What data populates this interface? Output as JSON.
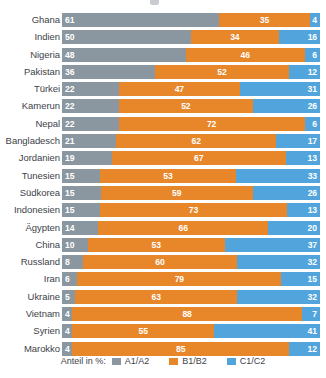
{
  "chart_data": {
    "type": "bar",
    "subtype": "horizontal-100-percent-stacked",
    "title": "",
    "xlabel": "",
    "ylabel": "",
    "xlim": [
      0,
      100
    ],
    "grid": false,
    "legend_position": "bottom",
    "legend_title": "Anteil in %:",
    "categories": [
      "Ghana",
      "Indien",
      "Nigeria",
      "Pakistan",
      "Türkei",
      "Kamerun",
      "Nepal",
      "Bangladesch",
      "Jordanien",
      "Tunesien",
      "Südkorea",
      "Indonesien",
      "Ägypten",
      "China",
      "Russland",
      "Iran",
      "Ukraine",
      "Vietnam",
      "Syrien",
      "Marokko"
    ],
    "series": [
      {
        "name": "A1/A2",
        "color": "#8a97a0",
        "values": [
          61,
          50,
          48,
          36,
          22,
          22,
          22,
          21,
          19,
          15,
          15,
          15,
          14,
          10,
          8,
          6,
          5,
          4,
          4,
          4
        ]
      },
      {
        "name": "B1/B2",
        "color": "#e8862a",
        "values": [
          35,
          34,
          46,
          52,
          47,
          52,
          72,
          62,
          67,
          53,
          59,
          73,
          66,
          53,
          60,
          79,
          63,
          88,
          55,
          85
        ]
      },
      {
        "name": "C1/C2",
        "color": "#52a5dc",
        "values": [
          4,
          16,
          6,
          12,
          31,
          26,
          6,
          17,
          13,
          33,
          26,
          13,
          20,
          37,
          32,
          15,
          32,
          7,
          41,
          12
        ]
      }
    ],
    "rows": [
      {
        "label": "Ghana",
        "a": 61,
        "b": 35,
        "c": 4
      },
      {
        "label": "Indien",
        "a": 50,
        "b": 34,
        "c": 16
      },
      {
        "label": "Nigeria",
        "a": 48,
        "b": 46,
        "c": 6
      },
      {
        "label": "Pakistan",
        "a": 36,
        "b": 52,
        "c": 12
      },
      {
        "label": "Türkei",
        "a": 22,
        "b": 47,
        "c": 31
      },
      {
        "label": "Kamerun",
        "a": 22,
        "b": 52,
        "c": 26
      },
      {
        "label": "Nepal",
        "a": 22,
        "b": 72,
        "c": 6
      },
      {
        "label": "Bangladesch",
        "a": 21,
        "b": 62,
        "c": 17
      },
      {
        "label": "Jordanien",
        "a": 19,
        "b": 67,
        "c": 13
      },
      {
        "label": "Tunesien",
        "a": 15,
        "b": 53,
        "c": 33
      },
      {
        "label": "Südkorea",
        "a": 15,
        "b": 59,
        "c": 26
      },
      {
        "label": "Indonesien",
        "a": 15,
        "b": 73,
        "c": 13
      },
      {
        "label": "Ägypten",
        "a": 14,
        "b": 66,
        "c": 20
      },
      {
        "label": "China",
        "a": 10,
        "b": 53,
        "c": 37
      },
      {
        "label": "Russland",
        "a": 8,
        "b": 60,
        "c": 32
      },
      {
        "label": "Iran",
        "a": 6,
        "b": 79,
        "c": 15
      },
      {
        "label": "Ukraine",
        "a": 5,
        "b": 63,
        "c": 32
      },
      {
        "label": "Vietnam",
        "a": 4,
        "b": 88,
        "c": 7
      },
      {
        "label": "Syrien",
        "a": 4,
        "b": 55,
        "c": 41
      },
      {
        "label": "Marokko",
        "a": 4,
        "b": 85,
        "c": 12
      }
    ]
  },
  "legend": {
    "title": "Anteil in %:",
    "items": [
      {
        "label": "A1/A2",
        "color": "#8a97a0"
      },
      {
        "label": "B1/B2",
        "color": "#e8862a"
      },
      {
        "label": "C1/C2",
        "color": "#52a5dc"
      }
    ]
  }
}
